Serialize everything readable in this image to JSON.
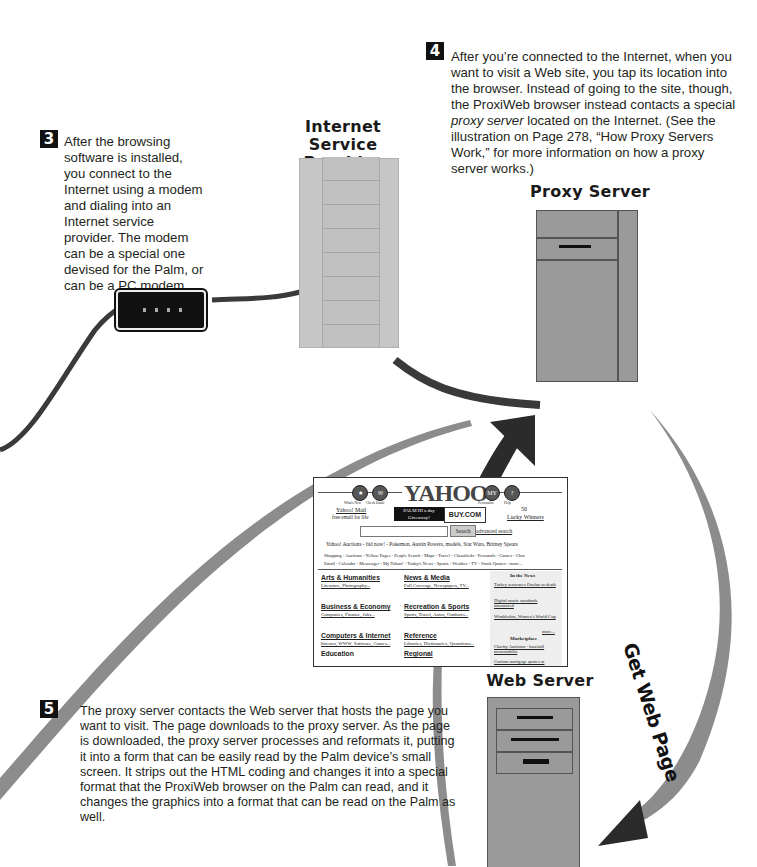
{
  "steps": [
    {
      "number": "3",
      "text": "After the browsing software is installed, you connect to the Internet using a modem and dialing into an Internet service provider. The modem can be a special one devised for the Palm, or can be a PC modem."
    },
    {
      "number": "4",
      "text_before": "After you’re connected to the Internet, when you want to visit a Web site, you tap its location into the browser. Instead of going to the site, though, the ProxiWeb browser instead contacts a special ",
      "text_italic": "proxy server",
      "text_after": " located on the Internet. (See the illustration on Page 278, “How Proxy Servers Work,” for more information on how a proxy server works.)"
    },
    {
      "number": "5",
      "text": "The proxy server contacts the Web server that hosts the page you want to visit. The page downloads to the proxy server. As the page is downloaded, the proxy server processes and reformats it, putting it into a form that can be easily read by the Palm device’s small screen. It strips out the HTML coding and changes it into a special format that the ProxiWeb browser on the Palm can read, and it changes the graphics into a format that can be read on the Palm as well."
    }
  ],
  "labels": {
    "isp_line1": "Internet",
    "isp_line2": "Service Provider",
    "proxy_server": "Proxy Server",
    "web_server": "Web Server",
    "arrow_label": "Get Web Page"
  },
  "yahoo_page": {
    "logo": "YAHOO!",
    "icons_left": [
      "What's New",
      "Check Email"
    ],
    "icons_right": [
      "Personalize",
      "Help"
    ],
    "mail_link": "Yahoo! Mail",
    "mail_sub": "free email for life",
    "banner_left": "PALM III a day Giveaway!",
    "banner_right": "BUY.COM",
    "winners_num": "50",
    "winners_link": "Lucky Winners",
    "search_button": "Search",
    "advanced_search": "advanced search",
    "auctions_line": "Yahoo! Auctions - bid now! - Pokemon, Austin Powers, models, Star Wars, Britney Spears",
    "nav_line1": "Shopping - Auctions - Yellow Pages - People Search - Maps - Travel - Classifieds - Personals - Games - Chat",
    "nav_line2": "Email - Calendar - Messenger - My Yahoo! - Today's News - Sports - Weather - TV - Stock Quotes - more...",
    "categories": [
      {
        "title": "Arts & Humanities",
        "sub": "Literature, Photography..."
      },
      {
        "title": "Business & Economy",
        "sub": "Companies, Finance, Jobs..."
      },
      {
        "title": "Computers & Internet",
        "sub": "Internet, WWW, Software, Games..."
      },
      {
        "title": "Education",
        "sub": "College and University, K-12..."
      },
      {
        "title": "News & Media",
        "sub": "Full Coverage, Newspapers, TV..."
      },
      {
        "title": "Recreation & Sports",
        "sub": "Sports, Travel, Autos, Outdoors..."
      },
      {
        "title": "Reference",
        "sub": "Libraries, Dictionaries, Quotations..."
      },
      {
        "title": "Regional",
        "sub": "Countries, Regions, US States..."
      }
    ],
    "news_title": "In the News",
    "news_items": [
      "Turkey sentences Ocalan to death",
      "Digital music standards announced",
      "Wimbledon, Women's World Cup"
    ],
    "news_more": "more...",
    "marketplace_title": "Marketplace",
    "marketplace_items": [
      "Charity Auctions - baseball memorabilia",
      "Custom mortgage quotes at"
    ]
  },
  "colors": {
    "arrow_dark": "#2b2b2b",
    "arrow_gray": "#8c8c8c",
    "server_gray": "#9a9a9a",
    "isp_gray": "#c6c6c6",
    "cable": "#3a3a3a"
  }
}
